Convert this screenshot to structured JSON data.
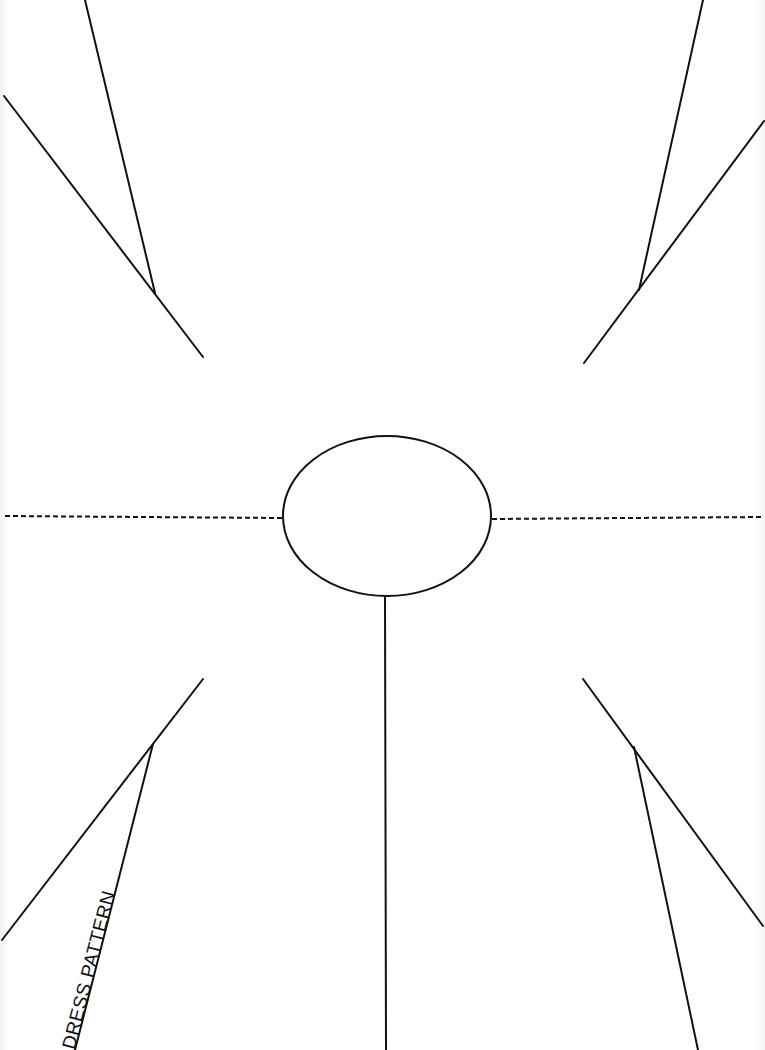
{
  "pattern": {
    "title": "DRESS PATTERN",
    "colors": {
      "background": "#ffffff",
      "ink": "#111111"
    },
    "elements": {
      "top_left_dart": {
        "outer_line": [
          [
            4,
            96
          ],
          [
            203,
            357
          ]
        ],
        "inner_line": [
          [
            85,
            0
          ],
          [
            155,
            293
          ]
        ]
      },
      "top_right_dart": {
        "outer_line": [
          [
            764,
            121
          ],
          [
            584,
            363
          ]
        ],
        "inner_line": [
          [
            703,
            0
          ],
          [
            639,
            290
          ]
        ]
      },
      "bottom_left_dart": {
        "outer_line": [
          [
            203,
            679
          ],
          [
            2,
            940
          ]
        ],
        "inner_line": [
          [
            153,
            744
          ],
          [
            75,
            1050
          ]
        ]
      },
      "bottom_right_dart": {
        "outer_line": [
          [
            583,
            679
          ],
          [
            763,
            926
          ]
        ],
        "inner_line": [
          [
            634,
            747
          ],
          [
            698,
            1050
          ]
        ]
      },
      "neck_hole": {
        "cx": 387,
        "cy": 516,
        "rx": 104,
        "ry": 80
      },
      "left_fold_line": [
        [
          5,
          516
        ],
        [
          283,
          518
        ]
      ],
      "right_fold_line": [
        [
          492,
          519
        ],
        [
          763,
          517
        ]
      ],
      "center_slit": [
        [
          385,
          596
        ],
        [
          386,
          1050
        ]
      ]
    }
  }
}
